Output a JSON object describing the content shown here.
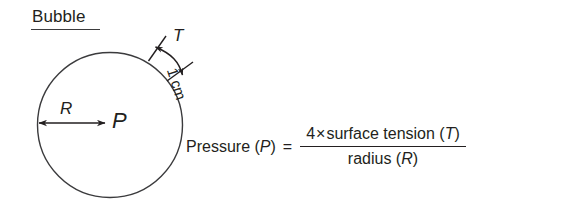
{
  "figure": {
    "title": "Bubble",
    "background_color": "#ffffff",
    "ink_color": "#231f20"
  },
  "diagram": {
    "shape": "circle",
    "center_x": 110,
    "center_y": 125,
    "radius": 72,
    "radius_label": "R",
    "pressure_label": "P",
    "surface_tension_label": "T",
    "thickness_label": "1 cm",
    "radius_arrow": {
      "from_x": 38,
      "from_y": 123,
      "to_x": 106,
      "to_y": 123,
      "double_headed": true
    },
    "tension_arc_arrow": {
      "double_headed": true,
      "start_angle_deg": -58,
      "end_angle_deg": -28
    }
  },
  "equation": {
    "lhs": "Pressure (",
    "lhs_var": "P",
    "lhs_close": ")",
    "equals": "=",
    "numerator_prefix": "4",
    "numerator_operator": "×",
    "numerator_text": "surface tension (",
    "numerator_var": "T",
    "numerator_close": ")",
    "denominator_text": "radius (",
    "denominator_var": "R",
    "denominator_close": ")"
  }
}
